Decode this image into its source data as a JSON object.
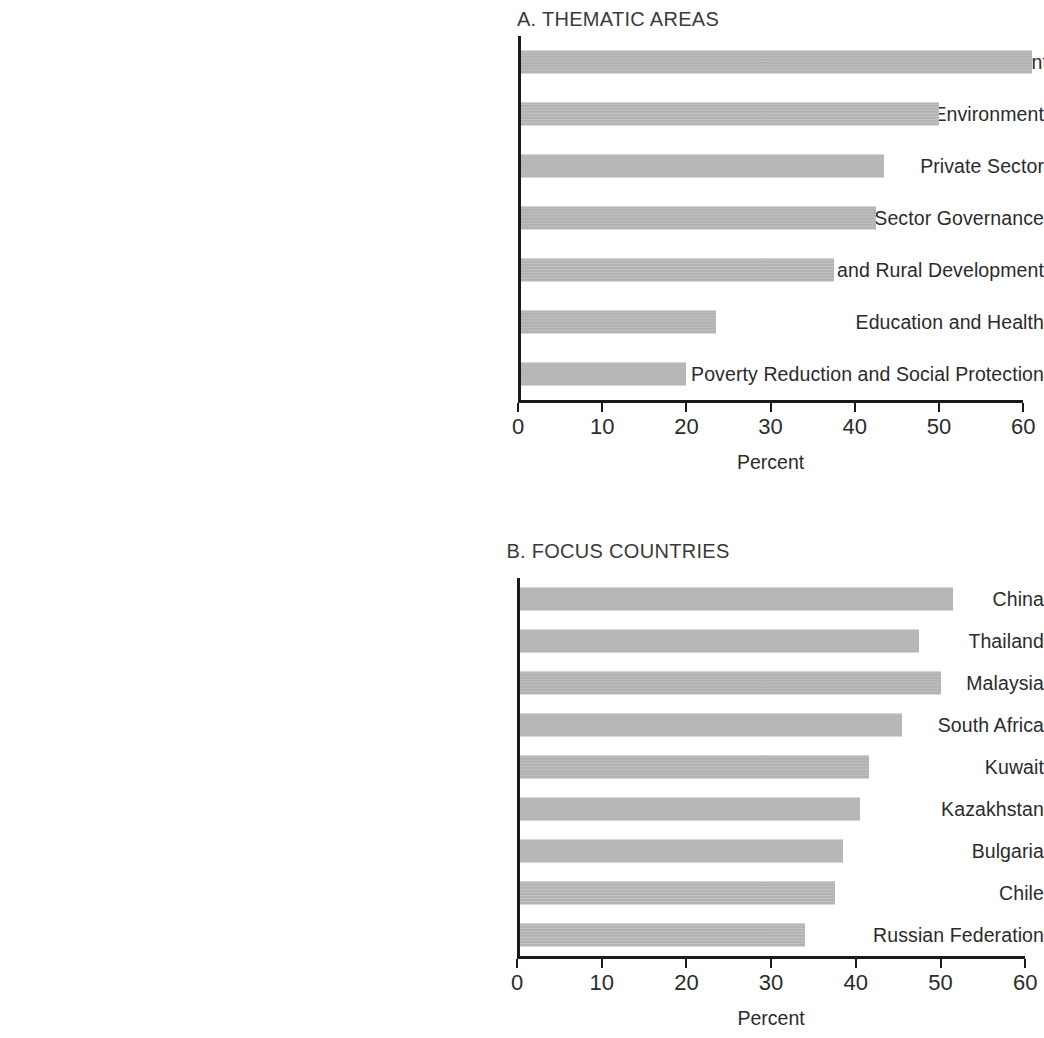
{
  "figure": {
    "bar_color": "#b3b3b3",
    "axis_color": "#1a1a1a",
    "text_color": "#2b2b2b"
  },
  "chart_data": [
    {
      "type": "bar",
      "orientation": "horizontal",
      "panel": "A",
      "title": "A. THEMATIC AREAS",
      "xlabel": "Percent",
      "ylabel": "",
      "xlim": [
        0,
        60
      ],
      "xticks": [
        0,
        10,
        20,
        30,
        40,
        50,
        60
      ],
      "xtick_labels": [
        "0",
        "10",
        "20",
        "30",
        "40",
        "50",
        "60"
      ],
      "grid": false,
      "legend": false,
      "categories": [
        "Financial Sector Development and Financial Management",
        "Infrastructure, Urban Development and Environment",
        "Private Sector",
        "Economic Policy and Public Sector Governance",
        "Agriculture and Rural Development",
        "Education and Health",
        "Poverty Reduction and Social Protection"
      ],
      "values": [
        61,
        50,
        43.5,
        42.5,
        37.5,
        23.5,
        20
      ]
    },
    {
      "type": "bar",
      "orientation": "horizontal",
      "panel": "B",
      "title": "B. FOCUS COUNTRIES",
      "xlabel": "Percent",
      "ylabel": "",
      "xlim": [
        0,
        60
      ],
      "xticks": [
        0,
        10,
        20,
        30,
        40,
        50,
        60
      ],
      "xtick_labels": [
        "0",
        "10",
        "20",
        "30",
        "40",
        "50",
        "60"
      ],
      "grid": false,
      "legend": false,
      "categories": [
        "China",
        "Thailand",
        "Malaysia",
        "South Africa",
        "Kuwait",
        "Kazakhstan",
        "Bulgaria",
        "Chile",
        "Russian Federation"
      ],
      "values": [
        51.5,
        47.5,
        50,
        45.5,
        41.5,
        40.5,
        38.5,
        37.5,
        34
      ]
    }
  ]
}
